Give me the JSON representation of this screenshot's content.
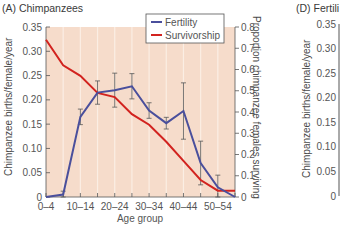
{
  "panel_a": {
    "title": "(A)  Chimpanzees",
    "ylabel_left": "Chimpanzee births/female/year",
    "ylabel_right": "Proportion chimpanzee females surviving",
    "xlabel": "Age group",
    "legend": [
      {
        "label": "Fertility",
        "color": "#4a4f9c"
      },
      {
        "label": "Survivorship",
        "color": "#d2231f"
      }
    ]
  },
  "panel_d": {
    "title": "(D)  Fertili",
    "ylabel_left": "Chimpanzee births/female/year",
    "yticks": [
      "0.35",
      "0.30",
      "0.25",
      "0.20",
      "0.15",
      "0.10",
      "0.05",
      "0"
    ]
  },
  "chart_data": [
    {
      "type": "line",
      "title": "(A) Chimpanzees",
      "xlabel": "Age group",
      "ylabel": "Chimpanzee births/female/year",
      "ylabel_right": "Proportion chimpanzee females surviving",
      "categories": [
        "0-4",
        "5-9",
        "10-14",
        "15-19",
        "20-24",
        "25-29",
        "30-34",
        "35-39",
        "40-44",
        "45-49",
        "50-54",
        "55-59"
      ],
      "xtick_labels": [
        "0–4",
        "10–14",
        "20–24",
        "30–34",
        "40–44",
        "50–54"
      ],
      "ylim_left": [
        0,
        0.35
      ],
      "yticks_left": [
        "0",
        "0.05",
        "0.10",
        "0.15",
        "0.20",
        "0.25",
        "0.30",
        "0.35"
      ],
      "ylim_right": [
        0,
        0.8
      ],
      "yticks_right": [
        "0",
        "0.1",
        "0.2",
        "0.3",
        "0.4",
        "0.5",
        "0.6",
        "0.7",
        "0.8"
      ],
      "grid": "vertical",
      "legend_position": "upper right",
      "series": [
        {
          "name": "Fertility",
          "axis": "left",
          "color": "#4a4f9c",
          "values": [
            0,
            0.005,
            0.165,
            0.215,
            0.22,
            0.228,
            0.178,
            0.152,
            0.177,
            0.07,
            0.02,
            0
          ],
          "error": [
            0,
            0.007,
            0.016,
            0.024,
            0.035,
            0.026,
            0.016,
            0.012,
            0.058,
            0.045,
            0.025,
            0
          ]
        },
        {
          "name": "Survivorship",
          "axis": "right",
          "color": "#d2231f",
          "values": [
            0.74,
            0.62,
            0.57,
            0.49,
            0.47,
            0.39,
            0.34,
            0.26,
            0.17,
            0.08,
            0.03,
            0.03
          ]
        }
      ]
    }
  ]
}
